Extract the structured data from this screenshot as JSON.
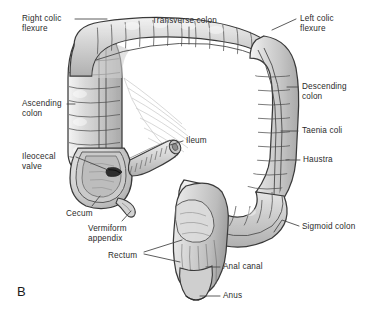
{
  "figure": {
    "panel_label": "B",
    "background_color": "#ffffff",
    "organ_fill_color": "#d9d9d9",
    "organ_outline_color": "#3a3a3a",
    "label_text_color": "#2b2b2b",
    "leader_line_color": "#4a4a4a"
  },
  "labels": [
    {
      "id": "right-colic-flexure",
      "line1": "Right colic",
      "line2": "flexure",
      "x": 22,
      "y": 14,
      "align": "left"
    },
    {
      "id": "transverse-colon",
      "line1": "Transverse colon",
      "line2": "",
      "x": 152,
      "y": 16,
      "align": "left"
    },
    {
      "id": "left-colic-flexure",
      "line1": "Left colic",
      "line2": "flexure",
      "x": 300,
      "y": 14,
      "align": "left"
    },
    {
      "id": "ascending-colon",
      "line1": "Ascending",
      "line2": "colon",
      "x": 22,
      "y": 99,
      "align": "left"
    },
    {
      "id": "descending-colon",
      "line1": "Descending",
      "line2": "colon",
      "x": 302,
      "y": 82,
      "align": "left"
    },
    {
      "id": "taenia-coli",
      "line1": "Taenia coli",
      "line2": "",
      "x": 302,
      "y": 126,
      "align": "left"
    },
    {
      "id": "ileocecal-valve",
      "line1": "Ileocecal",
      "line2": "valve",
      "x": 22,
      "y": 152,
      "align": "left"
    },
    {
      "id": "ileum",
      "line1": "Ileum",
      "line2": "",
      "x": 186,
      "y": 136,
      "align": "left"
    },
    {
      "id": "haustra",
      "line1": "Haustra",
      "line2": "",
      "x": 303,
      "y": 155,
      "align": "left"
    },
    {
      "id": "cecum",
      "line1": "Cecum",
      "line2": "",
      "x": 66,
      "y": 209,
      "align": "left"
    },
    {
      "id": "vermiform-appendix",
      "line1": "Vermiform",
      "line2": "appendix",
      "x": 88,
      "y": 224,
      "align": "left"
    },
    {
      "id": "sigmoid-colon",
      "line1": "Sigmoid colon",
      "line2": "",
      "x": 302,
      "y": 222,
      "align": "left"
    },
    {
      "id": "rectum",
      "line1": "Rectum",
      "line2": "",
      "x": 108,
      "y": 251,
      "align": "left"
    },
    {
      "id": "anal-canal",
      "line1": "Anal canal",
      "line2": "",
      "x": 223,
      "y": 262,
      "align": "left"
    },
    {
      "id": "anus",
      "line1": "Anus",
      "line2": "",
      "x": 223,
      "y": 291,
      "align": "left"
    }
  ],
  "structures": [
    {
      "id": "ascending-colon",
      "name": "Ascending colon"
    },
    {
      "id": "transverse-colon",
      "name": "Transverse colon"
    },
    {
      "id": "descending-colon",
      "name": "Descending colon"
    },
    {
      "id": "sigmoid-colon",
      "name": "Sigmoid colon"
    },
    {
      "id": "cecum",
      "name": "Cecum"
    },
    {
      "id": "vermiform-appendix",
      "name": "Vermiform appendix"
    },
    {
      "id": "ileum",
      "name": "Ileum"
    },
    {
      "id": "ileocecal-valve",
      "name": "Ileocecal valve"
    },
    {
      "id": "rectum",
      "name": "Rectum"
    },
    {
      "id": "anal-canal",
      "name": "Anal canal"
    },
    {
      "id": "anus",
      "name": "Anus"
    }
  ]
}
